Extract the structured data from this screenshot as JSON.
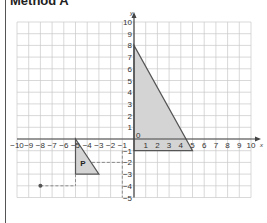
{
  "title": "Method A",
  "colors": {
    "grid": "#c8c8c8",
    "axis": "#444444",
    "shape_fill": "#d4d4d4",
    "shape_stroke": "#555555",
    "dashed": "#777777",
    "point": "#555555"
  },
  "axes": {
    "x_label": "x",
    "y_label": "y",
    "x_range": [
      -10,
      10
    ],
    "y_range": [
      -5,
      10
    ],
    "x_ticks": [
      "-10",
      "-9",
      "-8",
      "-7",
      "-6",
      "-5",
      "-4",
      "-3",
      "-2",
      "-1",
      "1",
      "2",
      "3",
      "4",
      "5",
      "6",
      "7",
      "8",
      "9",
      "10"
    ],
    "y_ticks": [
      "10",
      "9",
      "8",
      "7",
      "6",
      "5",
      "4",
      "3",
      "2",
      "1",
      "-1",
      "-2",
      "-3",
      "-4",
      "-5"
    ],
    "origin_label": "0"
  },
  "shapes": {
    "large_triangle": {
      "vertices": [
        [
          0,
          8
        ],
        [
          0,
          -1
        ],
        [
          5,
          -1
        ]
      ]
    },
    "triangle_p": {
      "label": "P",
      "vertices": [
        [
          -5,
          0
        ],
        [
          -5,
          -3
        ],
        [
          -3,
          -3
        ]
      ]
    },
    "point": {
      "coords": [
        -8,
        -4
      ]
    }
  },
  "dashed_lines": [
    {
      "from": [
        -8,
        -4
      ],
      "to": [
        -5,
        -4
      ]
    },
    {
      "from": [
        -5,
        -3
      ],
      "to": [
        -5,
        -4
      ]
    },
    {
      "from": [
        -3.6,
        -2
      ],
      "to": [
        -1,
        -2
      ]
    },
    {
      "from": [
        -1,
        -1
      ],
      "to": [
        -1,
        -5
      ]
    }
  ]
}
